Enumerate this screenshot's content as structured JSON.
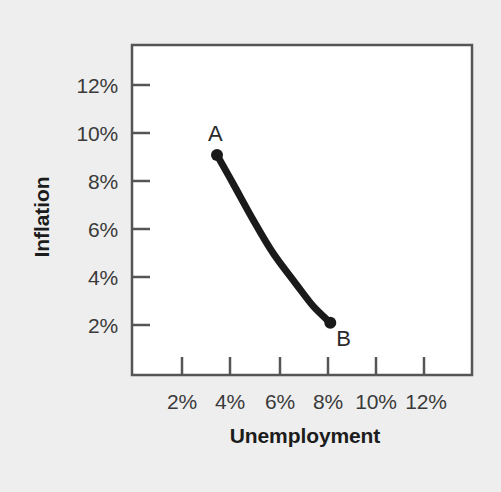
{
  "chart_data": {
    "type": "line",
    "title": "",
    "subtitle": "",
    "xlabel": "Unemployment",
    "ylabel": "Inflation",
    "xtick_labels": [
      "2%",
      "4%",
      "6%",
      "8%",
      "10%",
      "12%"
    ],
    "xtick_values": [
      2,
      4,
      6,
      8,
      10,
      12
    ],
    "ytick_labels": [
      "2%",
      "4%",
      "6%",
      "8%",
      "10%",
      "12%"
    ],
    "ytick_values": [
      2,
      4,
      6,
      8,
      10,
      12
    ],
    "xlim": [
      1,
      13
    ],
    "ylim": [
      1,
      13
    ],
    "grid": false,
    "legend": "none",
    "series": [
      {
        "name": "Phillips curve",
        "color": "#1a1a1a",
        "x": [
          4.0,
          4.6,
          5.3,
          6.0,
          6.8,
          7.4,
          8.0
        ],
        "y": [
          9.0,
          7.9,
          6.6,
          5.4,
          4.3,
          3.5,
          2.9
        ]
      }
    ],
    "annotations": [
      {
        "label": "A",
        "x": 4.0,
        "y": 9.0,
        "marker": true
      },
      {
        "label": "B",
        "x": 8.0,
        "y": 2.9,
        "marker": true
      }
    ]
  },
  "axis": {
    "y_title": "Inflation",
    "x_title": "Unemployment",
    "y_ticks": [
      {
        "label": "12%"
      },
      {
        "label": "10%"
      },
      {
        "label": "8%"
      },
      {
        "label": "6%"
      },
      {
        "label": "4%"
      },
      {
        "label": "2%"
      }
    ],
    "x_ticks": [
      {
        "label": "2%"
      },
      {
        "label": "4%"
      },
      {
        "label": "6%"
      },
      {
        "label": "8%"
      },
      {
        "label": "10%"
      },
      {
        "label": "12%"
      }
    ]
  },
  "points": {
    "a_label": "A",
    "b_label": "B"
  },
  "colors": {
    "background": "#eeeeee",
    "plot_background": "#ffffff",
    "frame": "#555555",
    "curve": "#1a1a1a",
    "tick_text": "#3a3a3a",
    "title_text": "#1c1c1c"
  }
}
